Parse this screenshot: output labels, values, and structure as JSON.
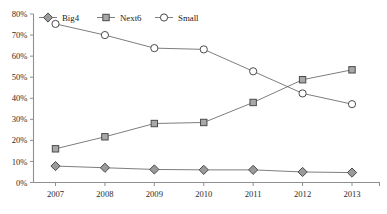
{
  "chart_data": {
    "type": "line",
    "title": "",
    "xlabel": "",
    "ylabel": "",
    "grid": false,
    "legend_position": "top-center",
    "categories": [
      "2007",
      "2008",
      "2009",
      "2010",
      "2011",
      "2012",
      "2013"
    ],
    "ylim": [
      0,
      80
    ],
    "ytick_labels": [
      "0%",
      "10%",
      "20%",
      "30%",
      "40%",
      "50%",
      "60%",
      "70%",
      "80%"
    ],
    "ytick_values": [
      0,
      10,
      20,
      30,
      40,
      50,
      60,
      70,
      80
    ],
    "series": [
      {
        "name": "Big4",
        "marker": "diamond",
        "marker_fill": "#9a9a9a",
        "line_color": "#6e6e6e",
        "values": [
          7.8,
          7.0,
          6.2,
          6.0,
          6.0,
          5.0,
          4.7
        ]
      },
      {
        "name": "Next6",
        "marker": "square",
        "marker_fill": "#a8a8a8",
        "line_color": "#6e6e6e",
        "values": [
          16.0,
          21.7,
          28.0,
          28.5,
          38.0,
          48.8,
          53.5
        ]
      },
      {
        "name": "Small",
        "marker": "circle",
        "marker_fill": "#ffffff",
        "line_color": "#6e6e6e",
        "values": [
          75.3,
          70.0,
          63.8,
          63.2,
          52.8,
          42.3,
          37.2
        ]
      }
    ]
  },
  "legend": {
    "items": [
      {
        "label": "Big4"
      },
      {
        "label": "Next6"
      },
      {
        "label": "Small"
      }
    ]
  },
  "axes": {
    "x_labels": [
      "2007",
      "2008",
      "2009",
      "2010",
      "2011",
      "2012",
      "2013"
    ],
    "y_labels": [
      "80%",
      "70%",
      "60%",
      "50%",
      "40%",
      "30%",
      "20%",
      "10%",
      "0%"
    ]
  },
  "colors": {
    "axis": "#8a8a8a",
    "line": "#6e6e6e",
    "marker_gray": "#9e9e9e",
    "text": "#1a1a1a"
  }
}
